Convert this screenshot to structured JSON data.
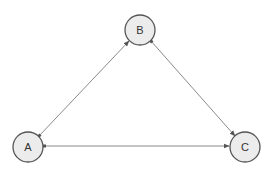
{
  "diagram": {
    "type": "directed-graph",
    "nodes": [
      {
        "id": "A",
        "label": "A",
        "cx": 28,
        "cy": 147,
        "r": 15
      },
      {
        "id": "B",
        "label": "B",
        "cx": 140,
        "cy": 30,
        "r": 15
      },
      {
        "id": "C",
        "label": "C",
        "cx": 245,
        "cy": 147,
        "r": 15
      }
    ],
    "edges": [
      {
        "from": "A",
        "to": "B",
        "bidirectional": true
      },
      {
        "from": "B",
        "to": "C",
        "bidirectional": true
      },
      {
        "from": "A",
        "to": "C",
        "bidirectional": true
      }
    ],
    "colors": {
      "node_fill": "#ececec",
      "node_stroke": "#555555",
      "edge": "#8a8a8a",
      "arrow": "#555555"
    }
  }
}
